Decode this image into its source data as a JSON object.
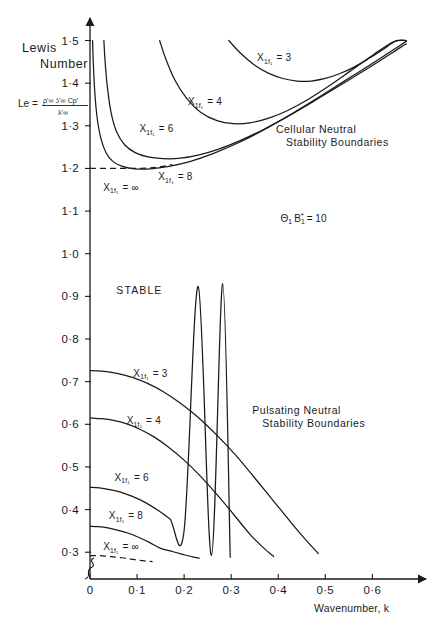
{
  "figure": {
    "title_lines": [
      "Lewis",
      "Number"
    ],
    "formula": {
      "lhs": "Le =",
      "numerator": "ρ'∞ ʖ'∞ Cp'",
      "denominator": "λ'∞"
    },
    "parameter_annotation": {
      "symbol": "Θ",
      "symbol_sub": "1",
      "symbol2": "B",
      "symbol2_star": "*",
      "symbol2_sub": "1",
      "equals": "= 10",
      "full_text": "Θ₁ B*₁ = 10"
    },
    "stable_region_label": "STABLE",
    "cellular_region_label_lines": [
      "Cellular  Neutral",
      "Stability  Boundaries"
    ],
    "pulsating_region_label_lines": [
      "Pulsating  Neutral",
      "Stability  Boundaries"
    ]
  },
  "chart_data": {
    "type": "line",
    "xlabel": "Wavenumber, k",
    "ylabel": "Lewis Number, Le",
    "xlim": [
      0,
      0.68
    ],
    "ylim": [
      0.27,
      1.52
    ],
    "grid": false,
    "legend": "inline-curve-labels",
    "xticks": [
      0,
      0.1,
      0.2,
      0.3,
      0.4,
      0.5,
      0.6
    ],
    "xtick_labels": [
      "0",
      "0·1",
      "0·2",
      "0·3",
      "0·4",
      "0·5",
      "0·6"
    ],
    "yticks": [
      0.3,
      0.4,
      0.5,
      0.6,
      0.7,
      0.8,
      0.9,
      1.0,
      1.1,
      1.2,
      1.3,
      1.4,
      1.5
    ],
    "ytick_labels": [
      "0·3",
      "0·4",
      "0·5",
      "0·6",
      "0·7",
      "0·8",
      "0·9",
      "1·0",
      "1·1",
      "1·2",
      "1·3",
      "1·4",
      "1·5"
    ],
    "y_axis_break": true,
    "series": [
      {
        "name": "cellular-Xf-3",
        "group": "Cellular Neutral Stability Boundaries",
        "label": "X₁f₁ = 3",
        "label_base": "X",
        "label_sub": "1f1",
        "label_value": "= 3",
        "style": "solid",
        "x": [
          0.295,
          0.32,
          0.35,
          0.38,
          0.41,
          0.44,
          0.47,
          0.5,
          0.53,
          0.56,
          0.59,
          0.62,
          0.65,
          0.672
        ],
        "y": [
          1.5,
          1.47,
          1.442,
          1.423,
          1.411,
          1.405,
          1.405,
          1.411,
          1.422,
          1.437,
          1.456,
          1.477,
          1.499,
          1.5
        ]
      },
      {
        "name": "cellular-Xf-4",
        "group": "Cellular Neutral Stability Boundaries",
        "label": "X₁f₁ = 4",
        "label_base": "X",
        "label_sub": "1f1",
        "label_value": "= 4",
        "style": "solid",
        "x": [
          0.148,
          0.16,
          0.18,
          0.205,
          0.235,
          0.27,
          0.305,
          0.34,
          0.38,
          0.42,
          0.465,
          0.51,
          0.555,
          0.6,
          0.645,
          0.672
        ],
        "y": [
          1.5,
          1.46,
          1.408,
          1.365,
          1.332,
          1.312,
          1.305,
          1.307,
          1.318,
          1.336,
          1.363,
          1.395,
          1.43,
          1.465,
          1.497,
          1.5
        ]
      },
      {
        "name": "cellular-Xf-6",
        "group": "Cellular Neutral Stability Boundaries",
        "label": "X₁f₁ = 6",
        "label_base": "X",
        "label_sub": "1f1",
        "label_value": "= 6",
        "style": "solid",
        "x": [
          0.0295,
          0.032,
          0.037,
          0.045,
          0.057,
          0.074,
          0.096,
          0.123,
          0.155,
          0.192,
          0.232,
          0.275,
          0.32,
          0.37,
          0.425,
          0.485,
          0.545,
          0.605,
          0.66,
          0.672
        ],
        "y": [
          1.5,
          1.452,
          1.39,
          1.33,
          1.285,
          1.255,
          1.237,
          1.227,
          1.223,
          1.224,
          1.232,
          1.246,
          1.266,
          1.292,
          1.325,
          1.364,
          1.404,
          1.445,
          1.484,
          1.492
        ]
      },
      {
        "name": "cellular-Xf-8",
        "group": "Cellular Neutral Stability Boundaries",
        "label": "X₁f₁ = 8",
        "label_base": "X",
        "label_sub": "1f1",
        "label_value": "= 8",
        "style": "solid",
        "x": [
          0.0055,
          0.007,
          0.01,
          0.015,
          0.023,
          0.034,
          0.049,
          0.069,
          0.095,
          0.128,
          0.168,
          0.212,
          0.26,
          0.313,
          0.37,
          0.43,
          0.492,
          0.555,
          0.618,
          0.672
        ],
        "y": [
          1.5,
          1.448,
          1.382,
          1.32,
          1.271,
          1.237,
          1.216,
          1.205,
          1.199,
          1.199,
          1.205,
          1.216,
          1.234,
          1.259,
          1.291,
          1.329,
          1.371,
          1.415,
          1.459,
          1.498
        ]
      },
      {
        "name": "cellular-Xf-inf",
        "group": "Cellular Neutral Stability Boundaries",
        "label": "X₁f₁ = ∞",
        "label_base": "X",
        "label_sub": "1f1",
        "label_value": "= ∞",
        "style": "dashed",
        "x": [
          0.0,
          0.04,
          0.08,
          0.12,
          0.15,
          0.175
        ],
        "y": [
          1.2,
          1.2,
          1.2,
          1.201,
          1.204,
          1.209
        ]
      },
      {
        "name": "pulsating-Xf-3",
        "group": "Pulsating Neutral Stability Boundaries",
        "label": "X₁f₁ = 3",
        "label_base": "X",
        "label_sub": "1f1",
        "label_value": "= 3",
        "style": "solid",
        "x": [
          0.0,
          0.03,
          0.06,
          0.09,
          0.12,
          0.155,
          0.19,
          0.23,
          0.27,
          0.31,
          0.35,
          0.39,
          0.43,
          0.46,
          0.485
        ],
        "y": [
          0.726,
          0.724,
          0.719,
          0.71,
          0.697,
          0.677,
          0.651,
          0.616,
          0.574,
          0.527,
          0.474,
          0.42,
          0.366,
          0.327,
          0.297
        ]
      },
      {
        "name": "pulsating-Xf-4",
        "group": "Pulsating Neutral Stability Boundaries",
        "label": "X₁f₁ = 4",
        "label_base": "X",
        "label_sub": "1f1",
        "label_value": "= 4",
        "style": "solid",
        "x": [
          0.0,
          0.025,
          0.05,
          0.078,
          0.105,
          0.135,
          0.165,
          0.2,
          0.235,
          0.27,
          0.305,
          0.34,
          0.37,
          0.39
        ],
        "y": [
          0.615,
          0.613,
          0.609,
          0.601,
          0.589,
          0.571,
          0.548,
          0.516,
          0.478,
          0.435,
          0.389,
          0.342,
          0.309,
          0.29
        ]
      },
      {
        "name": "pulsating-Xf-6",
        "group": "Pulsating Neutral Stability Boundaries",
        "label": "X₁f₁ = 6",
        "label_base": "X",
        "label_sub": "1f1",
        "label_value": "= 6",
        "style": "solid",
        "x": [
          0.0,
          0.02,
          0.042,
          0.065,
          0.09,
          0.115,
          0.142,
          0.17,
          0.2,
          0.23,
          0.258,
          0.282,
          0.298
        ],
        "y": [
          0.452,
          0.451,
          0.447,
          0.441,
          0.431,
          0.418,
          0.4,
          0.378,
          0.351,
          0.923,
          0.292,
          0.93,
          0.288
        ]
      },
      {
        "name": "pulsating-Xf-8",
        "group": "Pulsating Neutral Stability Boundaries",
        "label": "X₁f₁ = 8",
        "label_base": "X",
        "label_sub": "1f1",
        "label_value": "= 8",
        "style": "solid",
        "x": [
          0.0,
          0.018,
          0.038,
          0.058,
          0.08,
          0.103,
          0.126,
          0.15,
          0.174,
          0.197,
          0.218,
          0.232
        ],
        "y": [
          0.361,
          0.36,
          0.357,
          0.352,
          0.345,
          0.335,
          0.323,
          0.309,
          0.302,
          0.295,
          0.289,
          0.286
        ]
      },
      {
        "name": "pulsating-Xf-inf",
        "group": "Pulsating Neutral Stability Boundaries",
        "label": "X₁f₁ = ∞",
        "label_base": "X",
        "label_sub": "1f1",
        "label_value": "= ∞",
        "style": "dashed",
        "x": [
          0.0,
          0.015,
          0.032,
          0.05,
          0.068,
          0.086,
          0.104,
          0.12,
          0.133
        ],
        "y": [
          0.292,
          0.292,
          0.291,
          0.289,
          0.287,
          0.284,
          0.281,
          0.279,
          0.278
        ]
      }
    ],
    "curve_label_positions": [
      {
        "series": "cellular-Xf-3",
        "x": 0.355,
        "y": 1.452
      },
      {
        "series": "cellular-Xf-4",
        "x": 0.208,
        "y": 1.348
      },
      {
        "series": "cellular-Xf-6",
        "x": 0.105,
        "y": 1.285
      },
      {
        "series": "cellular-Xf-8",
        "x": 0.145,
        "y": 1.172
      },
      {
        "series": "cellular-Xf-inf",
        "x": 0.028,
        "y": 1.148
      },
      {
        "series": "pulsating-Xf-3",
        "x": 0.092,
        "y": 0.712
      },
      {
        "series": "pulsating-Xf-4",
        "x": 0.078,
        "y": 0.6
      },
      {
        "series": "pulsating-Xf-6",
        "x": 0.052,
        "y": 0.468
      },
      {
        "series": "pulsating-Xf-8",
        "x": 0.04,
        "y": 0.377
      },
      {
        "series": "pulsating-Xf-inf",
        "x": 0.028,
        "y": 0.305
      }
    ],
    "annotations": [
      {
        "name": "stable-region",
        "text": "STABLE",
        "x": 0.105,
        "y": 0.905
      },
      {
        "name": "parameter-note",
        "text": "Θ₁ B*₁ = 10",
        "x": 0.405,
        "y": 1.075
      },
      {
        "name": "cellular-boundaries-note",
        "text": "Cellular  Neutral Stability  Boundaries",
        "x": 0.395,
        "y": 1.282
      },
      {
        "name": "pulsating-boundaries-note",
        "text": "Pulsating  Neutral Stability  Boundaries",
        "x": 0.345,
        "y": 0.625
      }
    ]
  }
}
